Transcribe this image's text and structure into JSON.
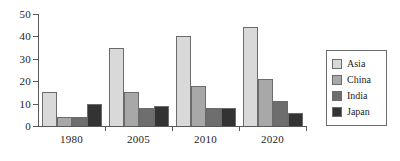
{
  "chart_data": {
    "type": "bar",
    "title": "",
    "subtitle": "",
    "xlabel": "",
    "ylabel": "",
    "categories": [
      "1980",
      "2005",
      "2010",
      "2020"
    ],
    "series": [
      {
        "name": "Asia",
        "color": "#d9d9d9",
        "values": [
          15,
          35,
          40,
          44
        ]
      },
      {
        "name": "China",
        "color": "#a8a8a8",
        "values": [
          4,
          15,
          18,
          21
        ]
      },
      {
        "name": "India",
        "color": "#6e6e6e",
        "values": [
          4,
          8,
          8,
          11
        ]
      },
      {
        "name": "Japan",
        "color": "#333333",
        "values": [
          10,
          9,
          8,
          6
        ]
      }
    ],
    "ylim": [
      0,
      50
    ],
    "yticks": [
      0,
      10,
      20,
      30,
      40,
      50
    ],
    "ytick_labels": [
      "0",
      "10",
      "20",
      "30",
      "40",
      "50"
    ],
    "grid": false,
    "legend_position": "right",
    "legend_entries": [
      "Asia",
      "China",
      "India",
      "Japan"
    ]
  }
}
